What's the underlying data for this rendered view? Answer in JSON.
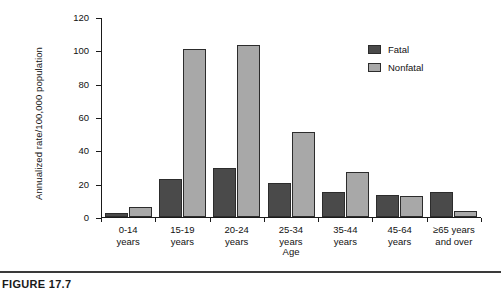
{
  "chart_data": {
    "type": "bar",
    "title": "",
    "xlabel": "Age",
    "ylabel": "Annualized rate/100,000 population",
    "categories": [
      "0-14 years",
      "15-19 years",
      "20-24 years",
      "25-34 years",
      "35-44 years",
      "45-64 years",
      "≥65 years and over"
    ],
    "category_lines": [
      [
        "0-14",
        "years"
      ],
      [
        "15-19",
        "years"
      ],
      [
        "20-24",
        "years"
      ],
      [
        "25-34",
        "years"
      ],
      [
        "35-44",
        "years"
      ],
      [
        "45-64",
        "years"
      ],
      [
        "≥65 years",
        "and over"
      ]
    ],
    "series": [
      {
        "name": "Fatal",
        "color": "#4a4a4a",
        "values": [
          2,
          22.5,
          29,
          20,
          15,
          13,
          15
        ]
      },
      {
        "name": "Nonfatal",
        "color": "#a8a8a8",
        "values": [
          6,
          100.5,
          103,
          51,
          27,
          12.5,
          3.5
        ]
      }
    ],
    "ylim": [
      0,
      120
    ],
    "yticks": [
      0,
      20,
      40,
      60,
      80,
      100,
      120
    ],
    "ytick_labels": [
      "0",
      "20",
      "40",
      "60",
      "80",
      "100",
      "120"
    ],
    "grid": false,
    "legend_position": "top-right"
  },
  "legend": {
    "items": [
      {
        "label": "Fatal",
        "color": "#4a4a4a"
      },
      {
        "label": "Nonfatal",
        "color": "#a8a8a8"
      }
    ]
  },
  "caption": {
    "text": "FIGURE 17.7"
  }
}
